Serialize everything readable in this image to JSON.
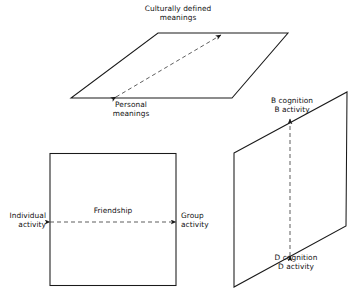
{
  "figure": {
    "title_absent": true,
    "stroke_color": "#1a1a1a",
    "dash_color": "#555555",
    "background": "#ffffff"
  },
  "top_plane": {
    "name": "upper-horizontal-plane",
    "top_label": {
      "line1": "Culturally defined",
      "line2": "meanings"
    },
    "bottom_label": {
      "line1": "Personal",
      "line2": "meanings"
    },
    "axis_arrow": "double-headed-dashed-diagonal"
  },
  "left_square": {
    "name": "friendship-square",
    "center_label": "Friendship",
    "left_label": {
      "line1": "Individual",
      "line2": "activity"
    },
    "right_label": {
      "line1": "Group",
      "line2": "activity"
    },
    "axis_arrow": "double-headed-dashed-horizontal"
  },
  "right_plane": {
    "name": "cognition-plane",
    "top_label": {
      "line1": "B cognition",
      "line2": "B activity"
    },
    "bottom_label": {
      "line1": "D cognition",
      "line2": "D activity"
    },
    "axis_arrow": "double-headed-dashed-vertical"
  }
}
